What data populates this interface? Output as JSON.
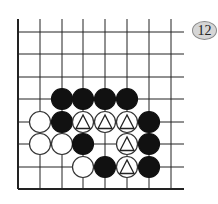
{
  "diagram": {
    "type": "go-board-fragment",
    "badge_label": "12",
    "grid": {
      "columns_x": [
        18,
        40,
        62,
        83,
        105,
        127,
        149,
        171
      ],
      "rows_y": [
        32,
        54,
        77,
        99,
        122,
        144,
        167,
        189
      ],
      "top_extent_y": 19,
      "right_extent_x": 184,
      "board_edges": [
        "left",
        "bottom"
      ]
    },
    "stone_radius": 10.5,
    "colors": {
      "black": "#111111",
      "white": "#ffffff",
      "line": "#222222",
      "badge_fill": "#d6d6d6"
    },
    "stones": [
      {
        "color": "black",
        "col": 2,
        "row": 3,
        "mark": ""
      },
      {
        "color": "black",
        "col": 3,
        "row": 3,
        "mark": ""
      },
      {
        "color": "black",
        "col": 4,
        "row": 3,
        "mark": ""
      },
      {
        "color": "black",
        "col": 5,
        "row": 3,
        "mark": ""
      },
      {
        "color": "white",
        "col": 1,
        "row": 4,
        "mark": ""
      },
      {
        "color": "black",
        "col": 2,
        "row": 4,
        "mark": ""
      },
      {
        "color": "white",
        "col": 3,
        "row": 4,
        "mark": "triangle"
      },
      {
        "color": "white",
        "col": 4,
        "row": 4,
        "mark": "triangle"
      },
      {
        "color": "white",
        "col": 5,
        "row": 4,
        "mark": "triangle"
      },
      {
        "color": "black",
        "col": 6,
        "row": 4,
        "mark": ""
      },
      {
        "color": "white",
        "col": 1,
        "row": 5,
        "mark": ""
      },
      {
        "color": "white",
        "col": 2,
        "row": 5,
        "mark": ""
      },
      {
        "color": "black",
        "col": 3,
        "row": 5,
        "mark": ""
      },
      {
        "color": "white",
        "col": 5,
        "row": 5,
        "mark": "triangle"
      },
      {
        "color": "black",
        "col": 6,
        "row": 5,
        "mark": ""
      },
      {
        "color": "white",
        "col": 3,
        "row": 6,
        "mark": ""
      },
      {
        "color": "black",
        "col": 4,
        "row": 6,
        "mark": ""
      },
      {
        "color": "white",
        "col": 5,
        "row": 6,
        "mark": "triangle"
      },
      {
        "color": "black",
        "col": 6,
        "row": 6,
        "mark": ""
      }
    ]
  }
}
